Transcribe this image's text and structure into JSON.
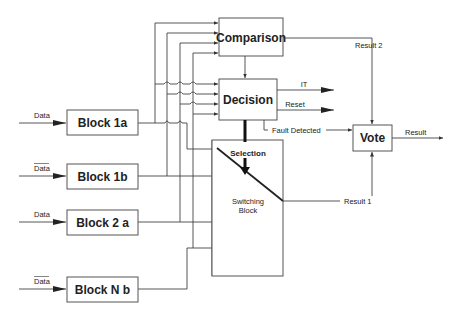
{
  "diagram": {
    "inputs": [
      {
        "label": "Data",
        "overbar": false
      },
      {
        "label": "Data",
        "overbar": true
      },
      {
        "label": "Data",
        "overbar": false
      },
      {
        "label": "Data",
        "overbar": true
      }
    ],
    "blocks": [
      {
        "id": "block-1a",
        "label": "Block 1a"
      },
      {
        "id": "block-1b",
        "label": "Block 1b"
      },
      {
        "id": "block-2a",
        "label": "Block 2 a"
      },
      {
        "id": "block-nb",
        "label": "Block N b"
      }
    ],
    "comparison": {
      "label": "Comparison"
    },
    "decision": {
      "label": "Decision"
    },
    "switching": {
      "label_line1": "Switching",
      "label_line2": "Block"
    },
    "vote": {
      "label": "Vote"
    },
    "signals": {
      "it": "IT",
      "reset": "Reset",
      "fault": "Fault Detected",
      "selection": "Selection",
      "result1": "Result 1",
      "result2": "Result 2",
      "result": "Result"
    }
  }
}
